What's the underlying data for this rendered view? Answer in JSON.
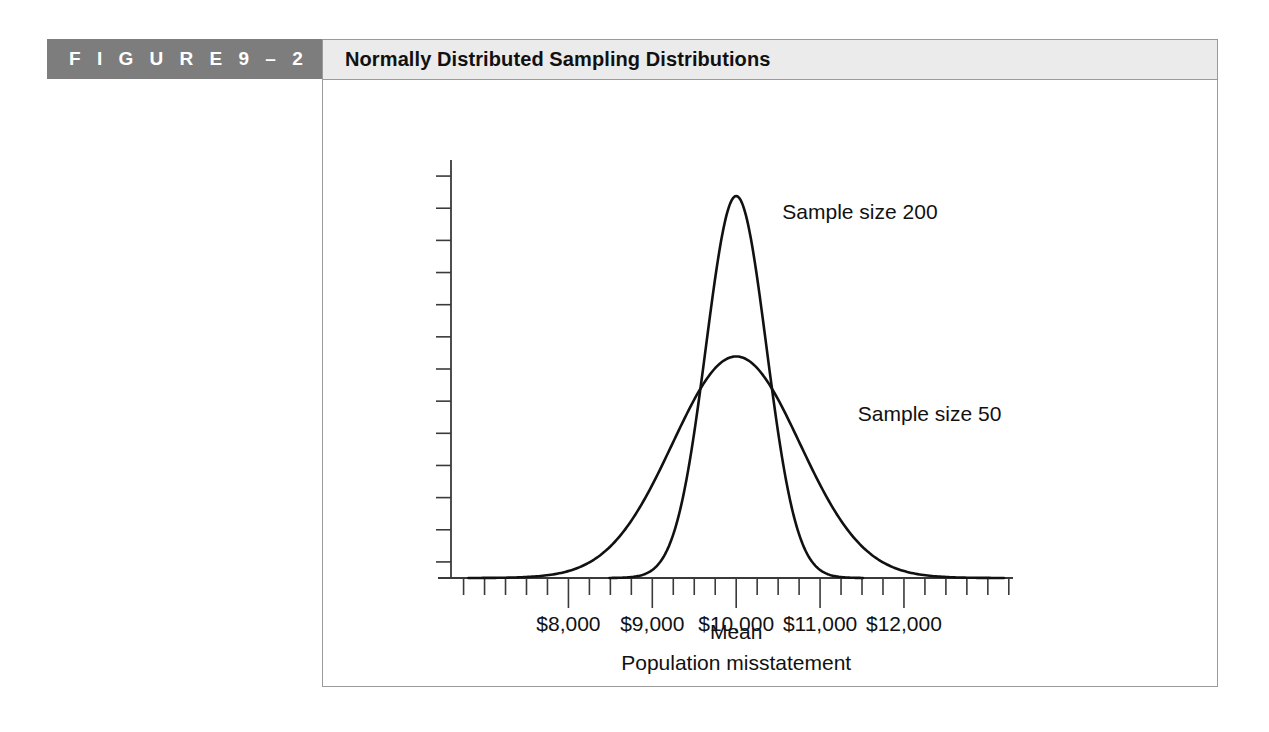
{
  "figure": {
    "label": "F I G U R E   9 – 2",
    "label_plain": "FIGURE 9-2",
    "title": "Normally Distributed Sampling Distributions",
    "banner_color": "#7d7d7d",
    "title_bar_color": "#ebebeb",
    "frame_border_color": "#9a9a9a"
  },
  "chart_data": {
    "type": "line",
    "title": "Normally Distributed Sampling Distributions",
    "xlabel": "Population misstatement",
    "ylabel": "",
    "x_tick_labels": [
      "$8,000",
      "$9,000",
      "$10,000",
      "$11,000",
      "$12,000"
    ],
    "x_tick_values": [
      8000,
      9000,
      10000,
      11000,
      12000
    ],
    "xlim": [
      6600,
      13300
    ],
    "ylim": [
      0,
      1.0
    ],
    "mean_annotation": "Mean",
    "mean_value": 10000,
    "grid": false,
    "legend_position": "inline-annotation",
    "y_axis_ticks": 13,
    "x_minor_tick_count": 26,
    "series": [
      {
        "name": "Sample size 200",
        "label": "Sample size 200",
        "mean": 10000,
        "sigma": 360,
        "peak_height": 1.0,
        "x": [
          8800,
          9000,
          9200,
          9400,
          9500,
          9600,
          9700,
          9800,
          9900,
          10000,
          10100,
          10200,
          10300,
          10400,
          10500,
          10600,
          10800,
          11000,
          11200
        ],
        "values": [
          0.0,
          0.01,
          0.04,
          0.12,
          0.21,
          0.33,
          0.49,
          0.68,
          0.86,
          1.0,
          0.93,
          0.76,
          0.55,
          0.35,
          0.2,
          0.1,
          0.02,
          0.0,
          0.0
        ]
      },
      {
        "name": "Sample size 50",
        "label": "Sample size 50",
        "mean": 10000,
        "sigma": 760,
        "peak_height": 0.58,
        "x": [
          7600,
          8000,
          8400,
          8800,
          9000,
          9200,
          9400,
          9600,
          9800,
          10000,
          10200,
          10400,
          10600,
          10800,
          11000,
          11400,
          11800,
          12200,
          12600
        ],
        "values": [
          0.0,
          0.03,
          0.09,
          0.2,
          0.28,
          0.37,
          0.46,
          0.53,
          0.57,
          0.58,
          0.57,
          0.53,
          0.46,
          0.37,
          0.28,
          0.13,
          0.05,
          0.01,
          0.0
        ]
      }
    ],
    "annotations": [
      {
        "text": "Sample size 200",
        "x": 10550,
        "y": 0.94
      },
      {
        "text": "Sample size 50",
        "x": 11450,
        "y": 0.41
      },
      {
        "text": "Mean",
        "x": 10000,
        "y": -0.16
      },
      {
        "text": "Population misstatement",
        "x": 10000,
        "y": -0.24
      }
    ]
  }
}
